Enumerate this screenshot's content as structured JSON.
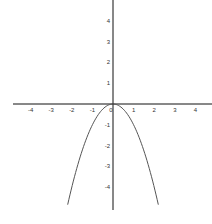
{
  "chart_data": {
    "type": "line",
    "title": "",
    "xlabel": "",
    "ylabel": "",
    "function": "y = -x^2",
    "xlim": [
      -4.9,
      4.8
    ],
    "ylim": [
      -5.1,
      5.0
    ],
    "grid": false,
    "legend": null,
    "x_ticks": [
      -4,
      -3,
      -2,
      -1,
      0,
      1,
      2,
      3,
      4
    ],
    "y_ticks": [
      4,
      3,
      2,
      1,
      -1,
      -2,
      -3,
      -4
    ],
    "x_tick_labels": [
      "-4",
      "-3",
      "-2",
      "-1",
      "0",
      "1",
      "2",
      "3",
      "4"
    ],
    "y_tick_labels": [
      "4",
      "3",
      "2",
      "1",
      "-1",
      "-2",
      "-3",
      "-4"
    ],
    "series": [
      {
        "name": "parabola",
        "x": [
          -2.2,
          -2.0,
          -1.5,
          -1.0,
          -0.5,
          0,
          0.5,
          1.0,
          1.5,
          2.0,
          2.2
        ],
        "y": [
          -4.84,
          -4.0,
          -2.25,
          -1.0,
          -0.25,
          0,
          -0.25,
          -1.0,
          -2.25,
          -4.0,
          -4.84
        ],
        "color": "#555555"
      }
    ]
  },
  "layout": {
    "origin_px": [
      113,
      104
    ],
    "unit_x_px": 20.6,
    "unit_y_px": 20.8,
    "axis_color": "#111111",
    "curve_color": "#555555"
  }
}
